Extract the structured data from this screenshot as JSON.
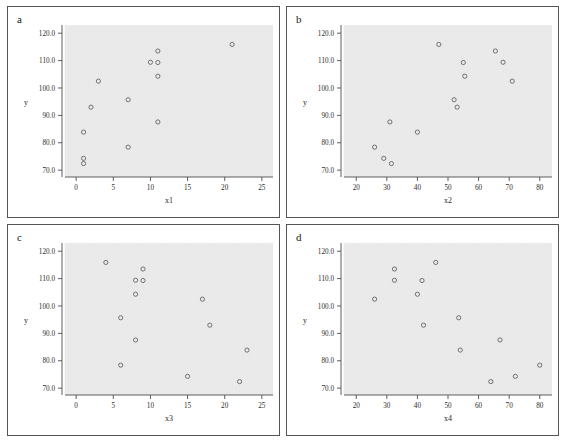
{
  "figure": {
    "background_color": "#ffffff",
    "panel_border_color": "#555555",
    "plot_background_color": "#ebebeb",
    "marker_color": "#646464"
  },
  "chart_data": [
    {
      "type": "scatter",
      "panel_label": "a",
      "title": "",
      "xlabel": "x1",
      "ylabel": "y",
      "xlim": [
        -1.5,
        26.5
      ],
      "ylim": [
        67.5,
        123.0
      ],
      "xticks": [
        0,
        5,
        10,
        15,
        20,
        25
      ],
      "xtick_labels": [
        "0",
        "5",
        "10",
        "15",
        "20",
        "25"
      ],
      "yticks": [
        70,
        80,
        90,
        100,
        110,
        120
      ],
      "ytick_labels": [
        "70.0",
        "80.0",
        "90.0",
        "100.0",
        "110.0",
        "120.0"
      ],
      "grid": false,
      "legend": "none",
      "x": [
        1,
        1,
        1,
        2,
        3,
        7,
        7,
        10,
        10,
        11,
        11,
        11,
        21
      ],
      "y": [
        72.4,
        74.3,
        83.9,
        93.0,
        102.5,
        78.4,
        95.7,
        109.4,
        113.5,
        104.3,
        109.3,
        87.6,
        115.9
      ],
      "points": [
        {
          "x": 1,
          "y": 72.4
        },
        {
          "x": 1,
          "y": 74.3
        },
        {
          "x": 1,
          "y": 83.9
        },
        {
          "x": 2,
          "y": 93.0
        },
        {
          "x": 3,
          "y": 102.5
        },
        {
          "x": 7,
          "y": 78.4
        },
        {
          "x": 7,
          "y": 95.7
        },
        {
          "x": 10,
          "y": 109.4
        },
        {
          "x": 11,
          "y": 113.5
        },
        {
          "x": 11,
          "y": 109.3
        },
        {
          "x": 11,
          "y": 104.3
        },
        {
          "x": 11,
          "y": 87.6
        },
        {
          "x": 21,
          "y": 115.9
        }
      ]
    },
    {
      "type": "scatter",
      "panel_label": "b",
      "title": "",
      "xlabel": "x2",
      "ylabel": "y",
      "xlim": [
        16.0,
        84.0
      ],
      "ylim": [
        67.5,
        123.0
      ],
      "xticks": [
        20,
        30,
        40,
        50,
        60,
        70,
        80
      ],
      "xtick_labels": [
        "20",
        "30",
        "40",
        "50",
        "60",
        "70",
        "80"
      ],
      "yticks": [
        70,
        80,
        90,
        100,
        110,
        120
      ],
      "ytick_labels": [
        "70.0",
        "80.0",
        "90.0",
        "100.0",
        "110.0",
        "120.0"
      ],
      "grid": false,
      "legend": "none",
      "x": [
        26,
        29,
        31,
        31.5,
        40,
        47,
        52,
        53,
        55,
        55.5,
        65.5,
        68,
        71
      ],
      "y": [
        78.4,
        74.3,
        87.6,
        72.4,
        83.9,
        115.9,
        95.7,
        93.0,
        109.3,
        104.3,
        113.5,
        109.4,
        102.5
      ],
      "points": [
        {
          "x": 26,
          "y": 78.4
        },
        {
          "x": 29,
          "y": 74.3
        },
        {
          "x": 31,
          "y": 87.6
        },
        {
          "x": 31.5,
          "y": 72.4
        },
        {
          "x": 40,
          "y": 83.9
        },
        {
          "x": 47,
          "y": 115.9
        },
        {
          "x": 52,
          "y": 95.7
        },
        {
          "x": 53,
          "y": 93.0
        },
        {
          "x": 55,
          "y": 109.3
        },
        {
          "x": 55.5,
          "y": 104.3
        },
        {
          "x": 65.5,
          "y": 113.5
        },
        {
          "x": 68,
          "y": 109.4
        },
        {
          "x": 71,
          "y": 102.5
        }
      ]
    },
    {
      "type": "scatter",
      "panel_label": "c",
      "title": "",
      "xlabel": "x3",
      "ylabel": "y",
      "xlim": [
        -1.5,
        26.5
      ],
      "ylim": [
        67.5,
        123.0
      ],
      "xticks": [
        0,
        5,
        10,
        15,
        20,
        25
      ],
      "xtick_labels": [
        "0",
        "5",
        "10",
        "15",
        "20",
        "25"
      ],
      "yticks": [
        70,
        80,
        90,
        100,
        110,
        120
      ],
      "ytick_labels": [
        "70.0",
        "80.0",
        "90.0",
        "100.0",
        "110.0",
        "120.0"
      ],
      "grid": false,
      "legend": false,
      "x": [
        4,
        6,
        6,
        8,
        8,
        8,
        9,
        9,
        15,
        17,
        18,
        22,
        23
      ],
      "y": [
        115.9,
        95.7,
        78.4,
        109.4,
        104.3,
        87.6,
        113.5,
        109.3,
        74.3,
        102.5,
        93.0,
        72.4,
        83.9
      ],
      "points": [
        {
          "x": 4,
          "y": 115.9
        },
        {
          "x": 6,
          "y": 95.7
        },
        {
          "x": 6,
          "y": 78.4
        },
        {
          "x": 8,
          "y": 109.4
        },
        {
          "x": 8,
          "y": 104.3
        },
        {
          "x": 8,
          "y": 87.6
        },
        {
          "x": 9,
          "y": 113.5
        },
        {
          "x": 9,
          "y": 109.3
        },
        {
          "x": 15,
          "y": 74.3
        },
        {
          "x": 17,
          "y": 102.5
        },
        {
          "x": 18,
          "y": 93.0
        },
        {
          "x": 22,
          "y": 72.4
        },
        {
          "x": 23,
          "y": 83.9
        }
      ]
    },
    {
      "type": "scatter",
      "panel_label": "d",
      "title": "",
      "xlabel": "x4",
      "ylabel": "y",
      "xlim": [
        16.0,
        84.0
      ],
      "ylim": [
        67.5,
        123.0
      ],
      "xticks": [
        20,
        30,
        40,
        50,
        60,
        70,
        80
      ],
      "xtick_labels": [
        "20",
        "30",
        "40",
        "50",
        "60",
        "70",
        "80"
      ],
      "yticks": [
        70,
        80,
        90,
        100,
        110,
        120
      ],
      "ytick_labels": [
        "70.0",
        "80.0",
        "90.0",
        "100.0",
        "110.0",
        "120.0"
      ],
      "grid": false,
      "legend": "none",
      "x": [
        26,
        32.5,
        32.5,
        40,
        41.5,
        42,
        46,
        53.5,
        54,
        64,
        67,
        72,
        80
      ],
      "y": [
        102.5,
        113.5,
        109.4,
        104.3,
        109.3,
        93.0,
        115.9,
        95.7,
        83.9,
        72.4,
        87.6,
        74.3,
        78.4
      ],
      "points": [
        {
          "x": 26,
          "y": 102.5
        },
        {
          "x": 32.5,
          "y": 113.5
        },
        {
          "x": 32.5,
          "y": 109.4
        },
        {
          "x": 40,
          "y": 104.3
        },
        {
          "x": 41.5,
          "y": 109.3
        },
        {
          "x": 42,
          "y": 93.0
        },
        {
          "x": 46,
          "y": 115.9
        },
        {
          "x": 53.5,
          "y": 95.7
        },
        {
          "x": 54,
          "y": 83.9
        },
        {
          "x": 64,
          "y": 72.4
        },
        {
          "x": 67,
          "y": 87.6
        },
        {
          "x": 72,
          "y": 74.3
        },
        {
          "x": 80,
          "y": 78.4
        }
      ]
    }
  ]
}
